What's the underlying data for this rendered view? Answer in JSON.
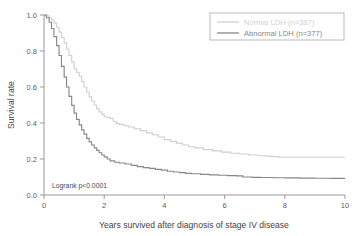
{
  "chart_data": {
    "type": "line",
    "title": "",
    "xlabel": "Years survived after diagnosis of stage IV disease",
    "ylabel": "Survival rate",
    "xlim": [
      0,
      10
    ],
    "ylim": [
      0,
      1.0
    ],
    "xticks": [
      "0",
      "2",
      "4",
      "6",
      "8",
      "10"
    ],
    "xtick_values": [
      0,
      2,
      4,
      6,
      8,
      10
    ],
    "yticks": [
      "0.0",
      "0.2",
      "0.4",
      "0.6",
      "0.8",
      "1.0"
    ],
    "ytick_values": [
      0.0,
      0.2,
      0.4,
      0.6,
      0.8,
      1.0
    ],
    "grid": false,
    "legend_position": "top-right",
    "annotations": [
      {
        "text": "Logrank p<0.0001",
        "x": 0.18,
        "y": 0.045
      }
    ],
    "series": [
      {
        "name": "Normal LDH (n=387)",
        "label": "Normal LDH (n=387)",
        "color": "#d0d0d0",
        "n": 387,
        "x": [
          0.0,
          0.08,
          0.17,
          0.25,
          0.33,
          0.42,
          0.5,
          0.58,
          0.67,
          0.75,
          0.83,
          0.92,
          1.0,
          1.08,
          1.17,
          1.25,
          1.33,
          1.42,
          1.5,
          1.58,
          1.67,
          1.75,
          1.83,
          1.92,
          2.0,
          2.1,
          2.2,
          2.3,
          2.4,
          2.5,
          2.65,
          2.8,
          3.0,
          3.2,
          3.4,
          3.6,
          3.8,
          4.0,
          4.2,
          4.4,
          4.6,
          4.8,
          5.0,
          5.3,
          5.6,
          5.9,
          6.2,
          6.5,
          6.8,
          7.1,
          7.4,
          7.6,
          7.8,
          8.2,
          8.6,
          9.0,
          9.4,
          10.0
        ],
        "y": [
          1.0,
          0.995,
          0.985,
          0.972,
          0.955,
          0.932,
          0.905,
          0.875,
          0.845,
          0.81,
          0.775,
          0.74,
          0.7,
          0.682,
          0.66,
          0.63,
          0.6,
          0.572,
          0.545,
          0.522,
          0.5,
          0.48,
          0.462,
          0.448,
          0.435,
          0.432,
          0.425,
          0.41,
          0.398,
          0.392,
          0.385,
          0.378,
          0.368,
          0.358,
          0.345,
          0.335,
          0.322,
          0.308,
          0.298,
          0.288,
          0.278,
          0.268,
          0.262,
          0.252,
          0.245,
          0.238,
          0.232,
          0.228,
          0.222,
          0.218,
          0.215,
          0.213,
          0.21,
          0.21,
          0.21,
          0.21,
          0.21,
          0.21
        ]
      },
      {
        "name": "Abnormal LDH (n=377)",
        "label": "Abnormal LDH (n=377)",
        "color": "#888888",
        "n": 377,
        "x": [
          0.0,
          0.08,
          0.17,
          0.25,
          0.33,
          0.42,
          0.5,
          0.58,
          0.67,
          0.75,
          0.83,
          0.92,
          1.0,
          1.08,
          1.17,
          1.25,
          1.33,
          1.42,
          1.5,
          1.58,
          1.67,
          1.75,
          1.83,
          1.92,
          2.0,
          2.1,
          2.2,
          2.35,
          2.5,
          2.7,
          2.9,
          3.1,
          3.3,
          3.5,
          3.7,
          3.9,
          4.1,
          4.3,
          4.5,
          4.7,
          4.9,
          5.2,
          5.5,
          5.8,
          6.1,
          6.4,
          6.6,
          6.9,
          7.2,
          7.6,
          8.0,
          8.5,
          9.0,
          9.5,
          10.0
        ],
        "y": [
          1.0,
          0.985,
          0.96,
          0.925,
          0.88,
          0.83,
          0.775,
          0.715,
          0.655,
          0.6,
          0.548,
          0.498,
          0.455,
          0.42,
          0.39,
          0.362,
          0.338,
          0.315,
          0.295,
          0.278,
          0.262,
          0.248,
          0.235,
          0.222,
          0.212,
          0.2,
          0.19,
          0.182,
          0.178,
          0.172,
          0.165,
          0.158,
          0.152,
          0.148,
          0.142,
          0.138,
          0.132,
          0.128,
          0.124,
          0.12,
          0.118,
          0.115,
          0.112,
          0.11,
          0.108,
          0.106,
          0.1,
          0.098,
          0.097,
          0.096,
          0.095,
          0.094,
          0.093,
          0.092,
          0.092
        ]
      }
    ]
  }
}
